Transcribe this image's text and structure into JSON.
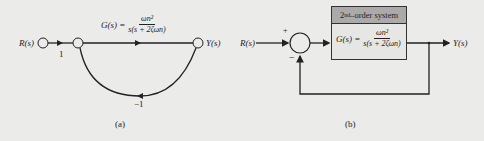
{
  "figure_a": {
    "input_label": "R(s)",
    "output_label": "Y(s)",
    "branch_gain_input": "1",
    "forward_gain_label": "G(s) =",
    "forward_gain_num": "ωn²",
    "forward_gain_den": "s(s + 2ζωn)",
    "feedback_gain": "−1",
    "caption": "(a)"
  },
  "figure_b": {
    "input_label": "R(s)",
    "output_label": "Y(s)",
    "sum_plus": "+",
    "sum_minus": "−",
    "block_header_order": "2",
    "block_header_sup": "nd",
    "block_header_text": "–order system",
    "block_gain_label": "G(s) =",
    "block_gain_num": "ωn²",
    "block_gain_den": "s(s + 2ζωn)",
    "caption": "(b)"
  },
  "colors": {
    "line": "#222222",
    "header_fill": "#aaaaaa",
    "background": "#ebebea"
  }
}
